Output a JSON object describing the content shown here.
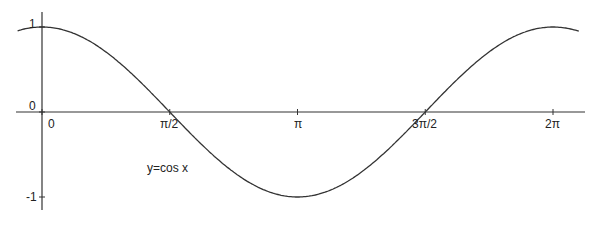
{
  "chart_data": {
    "type": "line",
    "title": "",
    "annotation": "y=cos x",
    "xlabel": "",
    "ylabel": "",
    "x_ticks": [
      "0",
      "π/2",
      "π",
      "3π/2",
      "2π"
    ],
    "x_tick_values": [
      0,
      1.5708,
      3.1416,
      4.7124,
      6.2832
    ],
    "y_ticks": [
      "1",
      "0",
      "-1"
    ],
    "y_tick_values": [
      1,
      0,
      -1
    ],
    "xlim": [
      -0.3,
      6.7
    ],
    "ylim": [
      -1.2,
      1.2
    ],
    "grid": false,
    "legend": "none",
    "series": [
      {
        "name": "y=cos x",
        "x": [
          -0.3,
          0,
          0.785,
          1.571,
          2.356,
          3.142,
          3.927,
          4.712,
          5.498,
          6.283,
          6.6
        ],
        "y": [
          0.955,
          1,
          0.707,
          0,
          -0.707,
          -1,
          -0.707,
          0,
          0.707,
          1,
          0.95
        ]
      }
    ]
  }
}
